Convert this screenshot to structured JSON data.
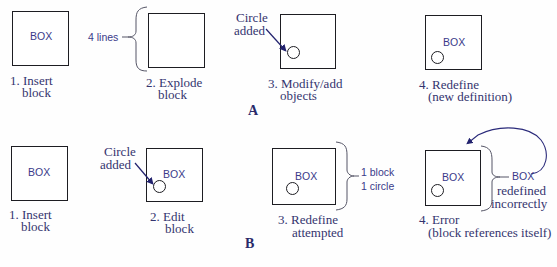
{
  "colors": {
    "line": "#1d1d22",
    "label_text": "#34346e",
    "sans_text": "#3a3a8a",
    "arrow": "#2a2a7a"
  },
  "row_a": {
    "section_label": "A",
    "steps": [
      {
        "box_text": "BOX",
        "caption_line1": "1. Insert",
        "caption_line2": "block"
      },
      {
        "box_text": "",
        "annotation": "4 lines",
        "caption_line1": "2. Explode",
        "caption_line2": "block"
      },
      {
        "box_text": "",
        "annotation_line1": "Circle",
        "annotation_line2": "added",
        "caption_line1": "3. Modify/add",
        "caption_line2": "objects"
      },
      {
        "box_text": "BOX",
        "caption_line1": "4. Redefine",
        "caption_line2": "(new definition)"
      }
    ]
  },
  "row_b": {
    "section_label": "B",
    "steps": [
      {
        "box_text": "BOX",
        "caption_line1": "1. Insert",
        "caption_line2": "block"
      },
      {
        "box_text": "BOX",
        "annotation_line1": "Circle",
        "annotation_line2": "added",
        "caption_line1": "2. Edit",
        "caption_line2": "block"
      },
      {
        "box_text": "BOX",
        "annotation_line1": "1 block",
        "annotation_line2": "1 circle",
        "caption_line1": "3. Redefine",
        "caption_line2": "attempted"
      },
      {
        "box_text": "BOX",
        "annotation_line1": "BOX",
        "annotation_line2": "redefined",
        "annotation_line3": "incorrectly",
        "caption_line1": "4. Error",
        "caption_line2": "(block references itself)"
      }
    ]
  }
}
